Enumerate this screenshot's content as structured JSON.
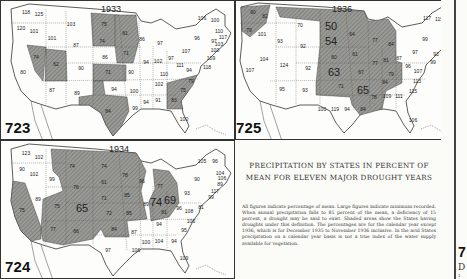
{
  "caption": {
    "title": "PRECIPITATION BY STATES IN PERCENT OF MEAN FOR ELEVEN MAJOR DROUGHT YEARS",
    "body": "All figures indicate percentage of mean. Large figures indicate minimum recorded. When annual precipitation falls to 85 percent of the mean, a deficiency of 15 percent, a drought may be said to exist. Shaded areas show the States having droughts under this definition. The percentages are for the calendar year except 1936, which is for December 1935 to November 1936 inclusive. In the arid States precipitation on a calendar year basis is not a true index of the water supply available for vegetation."
  },
  "edge": {
    "plate_fragment": "7",
    "letter_fragment": "D",
    "small_fragment": "1"
  },
  "colors": {
    "shaded": "#8a8a86",
    "unshaded": "#fdfdfb",
    "border": "#333333",
    "paper": "#fbfbf8"
  },
  "maps": [
    {
      "plate": "723",
      "year": "1933",
      "values": [
        {
          "label": "WA",
          "v": "118",
          "x": 25,
          "y": 11
        },
        {
          "label": "WA-coast",
          "v": "125",
          "x": 38,
          "y": 13
        },
        {
          "label": "OR",
          "v": "120",
          "x": 20,
          "y": 27
        },
        {
          "label": "ID-N",
          "v": "101",
          "x": 33,
          "y": 30
        },
        {
          "label": "MT",
          "v": "103",
          "x": 70,
          "y": 23
        },
        {
          "label": "ID",
          "v": "101",
          "x": 51,
          "y": 37
        },
        {
          "label": "WY",
          "v": "87",
          "x": 75,
          "y": 44
        },
        {
          "label": "NV",
          "v": "74",
          "x": 35,
          "y": 56,
          "shaded": true
        },
        {
          "label": "UT",
          "v": "62",
          "x": 55,
          "y": 63,
          "shaded": true
        },
        {
          "label": "CA",
          "v": "80",
          "x": 22,
          "y": 71
        },
        {
          "label": "CO",
          "v": "90",
          "x": 80,
          "y": 67
        },
        {
          "label": "AZ",
          "v": "87",
          "x": 51,
          "y": 89
        },
        {
          "label": "NM",
          "v": "89",
          "x": 76,
          "y": 92
        },
        {
          "label": "ND",
          "v": "75",
          "x": 103,
          "y": 23,
          "shaded": true
        },
        {
          "label": "SD",
          "v": "74",
          "x": 101,
          "y": 40,
          "shaded": true
        },
        {
          "label": "NE",
          "v": "86",
          "x": 104,
          "y": 56
        },
        {
          "label": "KS",
          "v": "71",
          "x": 107,
          "y": 71,
          "shaded": true
        },
        {
          "label": "OK",
          "v": "94",
          "x": 113,
          "y": 88
        },
        {
          "label": "TX",
          "v": "84",
          "x": 107,
          "y": 110,
          "shaded": true
        },
        {
          "label": "MN",
          "v": "81",
          "x": 124,
          "y": 32,
          "shaded": true
        },
        {
          "label": "IA",
          "v": "71",
          "x": 125,
          "y": 52,
          "shaded": true
        },
        {
          "label": "MO",
          "v": "90",
          "x": 130,
          "y": 71
        },
        {
          "label": "AR",
          "v": "100",
          "x": 133,
          "y": 90
        },
        {
          "label": "LA",
          "v": "99",
          "x": 134,
          "y": 107
        },
        {
          "label": "WI",
          "v": "86",
          "x": 141,
          "y": 38
        },
        {
          "label": "MI",
          "v": "97",
          "x": 159,
          "y": 42
        },
        {
          "label": "IL",
          "v": "94",
          "x": 145,
          "y": 61
        },
        {
          "label": "IN",
          "v": "102",
          "x": 157,
          "y": 60
        },
        {
          "label": "OH",
          "v": "97",
          "x": 170,
          "y": 57
        },
        {
          "label": "KY",
          "v": "110",
          "x": 163,
          "y": 73
        },
        {
          "label": "TN",
          "v": "102",
          "x": 158,
          "y": 83
        },
        {
          "label": "MS",
          "v": "94",
          "x": 145,
          "y": 101
        },
        {
          "label": "AL",
          "v": "91",
          "x": 157,
          "y": 99
        },
        {
          "label": "GA",
          "v": "83",
          "x": 173,
          "y": 99,
          "shaded": true
        },
        {
          "label": "SC",
          "v": "75",
          "x": 182,
          "y": 89,
          "shaded": true
        },
        {
          "label": "NC",
          "v": "79",
          "x": 190,
          "y": 80,
          "shaded": true
        },
        {
          "label": "FL",
          "v": "100",
          "x": 183,
          "y": 118
        },
        {
          "label": "WV",
          "v": "111",
          "x": 179,
          "y": 64
        },
        {
          "label": "VA",
          "v": "94",
          "x": 188,
          "y": 69
        },
        {
          "label": "PA",
          "v": "107",
          "x": 185,
          "y": 50
        },
        {
          "label": "NY",
          "v": "96",
          "x": 196,
          "y": 37
        },
        {
          "label": "VT",
          "v": "106",
          "x": 201,
          "y": 17
        },
        {
          "label": "ME",
          "v": "100",
          "x": 214,
          "y": 19
        },
        {
          "label": "NH",
          "v": "110",
          "x": 218,
          "y": 30
        },
        {
          "label": "MA",
          "v": "117",
          "x": 222,
          "y": 36
        },
        {
          "label": "CT",
          "v": "97",
          "x": 213,
          "y": 40
        },
        {
          "label": "RI",
          "v": "103",
          "x": 218,
          "y": 43
        },
        {
          "label": "NJ",
          "v": "100",
          "x": 214,
          "y": 49
        },
        {
          "label": "DE",
          "v": "109",
          "x": 210,
          "y": 57
        },
        {
          "label": "MD",
          "v": "118",
          "x": 206,
          "y": 66
        }
      ]
    },
    {
      "plate": "724",
      "year": "1934",
      "values": [
        {
          "label": "WA",
          "v": "123",
          "x": 25,
          "y": 12
        },
        {
          "label": "WA-E",
          "v": "102",
          "x": 38,
          "y": 16
        },
        {
          "label": "OR",
          "v": "90",
          "x": 21,
          "y": 28
        },
        {
          "label": "OR-E",
          "v": "102",
          "x": 33,
          "y": 33
        },
        {
          "label": "ID",
          "v": "99",
          "x": 51,
          "y": 38
        },
        {
          "label": "MT",
          "v": "74",
          "x": 71,
          "y": 25,
          "shaded": true
        },
        {
          "label": "WY",
          "v": "76",
          "x": 75,
          "y": 46,
          "shaded": true
        },
        {
          "label": "NV",
          "v": "89",
          "x": 37,
          "y": 58
        },
        {
          "label": "CA",
          "v": "75",
          "x": 21,
          "y": 69,
          "shaded": true
        },
        {
          "label": "UT",
          "v": "75",
          "x": 56,
          "y": 65,
          "shaded": true
        },
        {
          "label": "CO",
          "v": "65",
          "x": 81,
          "y": 67,
          "shaded": true,
          "big": true
        },
        {
          "label": "AZ",
          "v": "77",
          "x": 52,
          "y": 88,
          "shaded": true
        },
        {
          "label": "NM",
          "v": "66",
          "x": 75,
          "y": 90,
          "shaded": true
        },
        {
          "label": "ND",
          "v": "74",
          "x": 103,
          "y": 25,
          "shaded": true
        },
        {
          "label": "SD",
          "v": "61",
          "x": 103,
          "y": 41,
          "shaded": true
        },
        {
          "label": "NE",
          "v": "71",
          "x": 103,
          "y": 57,
          "shaded": true
        },
        {
          "label": "KS",
          "v": "72",
          "x": 108,
          "y": 72,
          "shaded": true
        },
        {
          "label": "OK",
          "v": "84",
          "x": 113,
          "y": 88,
          "shaded": true
        },
        {
          "label": "TX",
          "v": "97",
          "x": 107,
          "y": 109
        },
        {
          "label": "MN",
          "v": "78",
          "x": 124,
          "y": 34,
          "shaded": true
        },
        {
          "label": "IA",
          "v": "85",
          "x": 126,
          "y": 54,
          "shaded": true
        },
        {
          "label": "MO",
          "v": "85",
          "x": 128,
          "y": 72,
          "shaded": true
        },
        {
          "label": "AR",
          "v": "87",
          "x": 133,
          "y": 91
        },
        {
          "label": "LA",
          "v": "106",
          "x": 135,
          "y": 109
        },
        {
          "label": "WI",
          "v": "96",
          "x": 141,
          "y": 40
        },
        {
          "label": "MI",
          "v": "77",
          "x": 159,
          "y": 45,
          "shaded": true
        },
        {
          "label": "IL",
          "v": "89",
          "x": 145,
          "y": 63
        },
        {
          "label": "IN",
          "v": "74",
          "x": 155,
          "y": 61,
          "shaded": true,
          "big": true
        },
        {
          "label": "OH",
          "v": "69",
          "x": 169,
          "y": 59,
          "shaded": true,
          "big": true
        },
        {
          "label": "KY",
          "v": "81",
          "x": 163,
          "y": 71,
          "shaded": true
        },
        {
          "label": "TN",
          "v": "94",
          "x": 158,
          "y": 83
        },
        {
          "label": "MS",
          "v": "100",
          "x": 145,
          "y": 101
        },
        {
          "label": "AL",
          "v": "104",
          "x": 158,
          "y": 100
        },
        {
          "label": "GA",
          "v": "94",
          "x": 173,
          "y": 100
        },
        {
          "label": "SC",
          "v": "95",
          "x": 183,
          "y": 89
        },
        {
          "label": "NC",
          "v": "106",
          "x": 190,
          "y": 80
        },
        {
          "label": "FL",
          "v": "109",
          "x": 183,
          "y": 117
        },
        {
          "label": "WV",
          "v": "96",
          "x": 178,
          "y": 67
        },
        {
          "label": "VA",
          "v": "108",
          "x": 188,
          "y": 70
        },
        {
          "label": "MD",
          "v": "81",
          "x": 200,
          "y": 66
        },
        {
          "label": "PA",
          "v": "93",
          "x": 186,
          "y": 52
        },
        {
          "label": "NY",
          "v": "90",
          "x": 196,
          "y": 38
        },
        {
          "label": "VT",
          "v": "105",
          "x": 201,
          "y": 20
        },
        {
          "label": "ME",
          "v": "96",
          "x": 214,
          "y": 20
        },
        {
          "label": "NH",
          "v": "104",
          "x": 219,
          "y": 32
        },
        {
          "label": "MA",
          "v": "106",
          "x": 221,
          "y": 37
        },
        {
          "label": "CT",
          "v": "89",
          "x": 219,
          "y": 43
        },
        {
          "label": "RI",
          "v": "117",
          "x": 214,
          "y": 50
        },
        {
          "label": "NJ",
          "v": "99",
          "x": 210,
          "y": 56
        }
      ]
    },
    {
      "plate": "725",
      "year": "1936",
      "values": [
        {
          "label": "WA",
          "v": "90",
          "x": 17,
          "y": 11,
          "shaded": true
        },
        {
          "label": "WA-E",
          "v": "82",
          "x": 29,
          "y": 15,
          "shaded": true
        },
        {
          "label": "OR",
          "v": "79",
          "x": 13,
          "y": 29,
          "shaded": true
        },
        {
          "label": "OR-E",
          "v": "101",
          "x": 26,
          "y": 33
        },
        {
          "label": "ID",
          "v": "93",
          "x": 44,
          "y": 40
        },
        {
          "label": "MT",
          "v": "70",
          "x": 64,
          "y": 24,
          "shaded": true
        },
        {
          "label": "WY",
          "v": "92",
          "x": 67,
          "y": 45
        },
        {
          "label": "NV",
          "v": "104",
          "x": 28,
          "y": 58
        },
        {
          "label": "CA",
          "v": "107",
          "x": 14,
          "y": 69
        },
        {
          "label": "UT",
          "v": "124",
          "x": 48,
          "y": 64
        },
        {
          "label": "CO",
          "v": "92",
          "x": 72,
          "y": 67
        },
        {
          "label": "AZ",
          "v": "95",
          "x": 46,
          "y": 88
        },
        {
          "label": "NM",
          "v": "93",
          "x": 69,
          "y": 89
        },
        {
          "label": "ND",
          "v": "50",
          "x": 95,
          "y": 25,
          "shaded": true,
          "big": true
        },
        {
          "label": "SD",
          "v": "54",
          "x": 95,
          "y": 40,
          "shaded": true,
          "big": true
        },
        {
          "label": "NE",
          "v": "60",
          "x": 98,
          "y": 56,
          "shaded": true
        },
        {
          "label": "KS",
          "v": "63",
          "x": 98,
          "y": 71,
          "shaded": true,
          "big": true
        },
        {
          "label": "OK",
          "v": "71",
          "x": 105,
          "y": 85,
          "shaded": true
        },
        {
          "label": "TX-W",
          "v": "100",
          "x": 86,
          "y": 108
        },
        {
          "label": "TX",
          "v": "119",
          "x": 99,
          "y": 108
        },
        {
          "label": "TX-E",
          "v": "94",
          "x": 111,
          "y": 108
        },
        {
          "label": "MN",
          "v": "64",
          "x": 116,
          "y": 33,
          "shaded": true
        },
        {
          "label": "IA",
          "v": "61",
          "x": 119,
          "y": 53,
          "shaded": true
        },
        {
          "label": "MO",
          "v": "67",
          "x": 125,
          "y": 71,
          "shaded": true
        },
        {
          "label": "AR",
          "v": "65",
          "x": 127,
          "y": 89,
          "shaded": true,
          "big": true
        },
        {
          "label": "LA",
          "v": "84",
          "x": 127,
          "y": 108,
          "shaded": true
        },
        {
          "label": "WI",
          "v": "77",
          "x": 139,
          "y": 39,
          "shaded": true
        },
        {
          "label": "MI",
          "v": "84",
          "x": 155,
          "y": 43,
          "shaded": true
        },
        {
          "label": "IL",
          "v": "77",
          "x": 139,
          "y": 62,
          "shaded": true
        },
        {
          "label": "IN",
          "v": "81",
          "x": 150,
          "y": 59,
          "shaded": true
        },
        {
          "label": "OH",
          "v": "87",
          "x": 163,
          "y": 57
        },
        {
          "label": "KY",
          "v": "79",
          "x": 155,
          "y": 73,
          "shaded": true
        },
        {
          "label": "TN",
          "v": "84",
          "x": 149,
          "y": 81,
          "shaded": true
        },
        {
          "label": "MS",
          "v": "78",
          "x": 138,
          "y": 96,
          "shaded": true
        },
        {
          "label": "AL",
          "v": "109",
          "x": 151,
          "y": 95
        },
        {
          "label": "GA",
          "v": "111",
          "x": 163,
          "y": 95
        },
        {
          "label": "SC",
          "v": "115",
          "x": 177,
          "y": 90
        },
        {
          "label": "NC",
          "v": "113",
          "x": 181,
          "y": 80
        },
        {
          "label": "FL",
          "v": "106",
          "x": 177,
          "y": 119
        },
        {
          "label": "WV",
          "v": "96",
          "x": 172,
          "y": 65
        },
        {
          "label": "VA",
          "v": "107",
          "x": 182,
          "y": 70
        },
        {
          "label": "PA",
          "v": "97",
          "x": 179,
          "y": 51
        },
        {
          "label": "NY",
          "v": "99",
          "x": 189,
          "y": 38
        },
        {
          "label": "VT",
          "v": "117",
          "x": 191,
          "y": 17
        },
        {
          "label": "ME",
          "v": "115",
          "x": 203,
          "y": 18
        },
        {
          "label": "NH",
          "v": "115",
          "x": 211,
          "y": 28
        },
        {
          "label": "MA",
          "v": "106",
          "x": 211,
          "y": 33
        },
        {
          "label": "CT",
          "v": "96",
          "x": 211,
          "y": 38
        },
        {
          "label": "RI",
          "v": "104",
          "x": 209,
          "y": 47
        },
        {
          "label": "NJ",
          "v": "93",
          "x": 200,
          "y": 53
        },
        {
          "label": "DE",
          "v": "99",
          "x": 197,
          "y": 61
        }
      ]
    }
  ]
}
